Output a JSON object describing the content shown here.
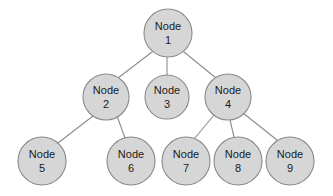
{
  "diagram": {
    "type": "tree",
    "background_color": "#ffffff",
    "node_fill_color": "#d6d6d6",
    "node_stroke_color": "#8a8a8a",
    "edge_color": "#8c8c8c",
    "text_color": "#1a1a1a",
    "node_label_prefix": "Node",
    "nodes": [
      {
        "id": "1",
        "prefix": "Node",
        "number": "1",
        "cx": 168,
        "cy": 33,
        "r": 24
      },
      {
        "id": "2",
        "prefix": "Node",
        "number": "2",
        "cx": 106,
        "cy": 97,
        "r": 23
      },
      {
        "id": "3",
        "prefix": "Node",
        "number": "3",
        "cx": 167,
        "cy": 97,
        "r": 22
      },
      {
        "id": "4",
        "prefix": "Node",
        "number": "4",
        "cx": 228,
        "cy": 97,
        "r": 23
      },
      {
        "id": "5",
        "prefix": "Node",
        "number": "5",
        "cx": 42,
        "cy": 161,
        "r": 24
      },
      {
        "id": "6",
        "prefix": "Node",
        "number": "6",
        "cx": 131,
        "cy": 161,
        "r": 24
      },
      {
        "id": "7",
        "prefix": "Node",
        "number": "7",
        "cx": 186,
        "cy": 161,
        "r": 24
      },
      {
        "id": "8",
        "prefix": "Node",
        "number": "8",
        "cx": 238,
        "cy": 161,
        "r": 24
      },
      {
        "id": "9",
        "prefix": "Node",
        "number": "9",
        "cx": 290,
        "cy": 161,
        "r": 24
      }
    ],
    "edges": [
      {
        "from": "1",
        "to": "2",
        "x1": 152,
        "y1": 52,
        "x2": 118,
        "y2": 78
      },
      {
        "from": "1",
        "to": "3",
        "x1": 167,
        "y1": 57,
        "x2": 167,
        "y2": 75
      },
      {
        "from": "1",
        "to": "4",
        "x1": 184,
        "y1": 52,
        "x2": 216,
        "y2": 78
      },
      {
        "from": "2",
        "to": "5",
        "x1": 93,
        "y1": 116,
        "x2": 58,
        "y2": 143
      },
      {
        "from": "2",
        "to": "6",
        "x1": 117,
        "y1": 116,
        "x2": 125,
        "y2": 138
      },
      {
        "from": "4",
        "to": "7",
        "x1": 215,
        "y1": 114,
        "x2": 194,
        "y2": 139
      },
      {
        "from": "4",
        "to": "8",
        "x1": 230,
        "y1": 120,
        "x2": 234,
        "y2": 137
      },
      {
        "from": "4",
        "to": "9",
        "x1": 243,
        "y1": 113,
        "x2": 277,
        "y2": 140
      }
    ]
  }
}
